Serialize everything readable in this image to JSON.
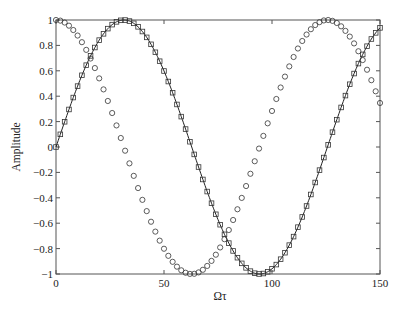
{
  "chart_data": {
    "type": "line",
    "title": "",
    "xlabel": "Ωτ",
    "ylabel": "Amplitude",
    "xlim": [
      0,
      150
    ],
    "ylim": [
      -1,
      1
    ],
    "grid": false,
    "legend": null,
    "xticks": [
      0,
      50,
      100,
      150
    ],
    "xtick_labels": [
      "0",
      "50",
      "100",
      "150"
    ],
    "yticks": [
      -1,
      -0.8,
      -0.6,
      -0.4,
      -0.2,
      0,
      0.2,
      0.4,
      0.6,
      0.8,
      1
    ],
    "ytick_labels": [
      "−1",
      "−0.8",
      "−0.6",
      "−0.4",
      "−0.2",
      "0",
      "0.2",
      "0.4",
      "0.6",
      "0.8",
      "1"
    ],
    "series": [
      {
        "name": "cosine (circles)",
        "marker": "circle",
        "line": false,
        "function": "cos(0.05·x)",
        "x_step": 2,
        "x_start": 0,
        "x_end": 150
      },
      {
        "name": "sine (squares + line)",
        "marker": "square",
        "line": true,
        "function": "sin(0.05·x)",
        "x_step": 2,
        "x_start": 0,
        "x_end": 150
      }
    ],
    "key_points": {
      "cosine_peaks": [
        0,
        125.7
      ],
      "cosine_trough": 62.8,
      "sine_peak": 31.4,
      "sine_trough": 94.2,
      "end_values": {
        "cosine": 0.35,
        "sine": 0.94
      }
    },
    "colors": {
      "axis": "#555555",
      "marker": "#333333",
      "line": "#222222"
    }
  }
}
